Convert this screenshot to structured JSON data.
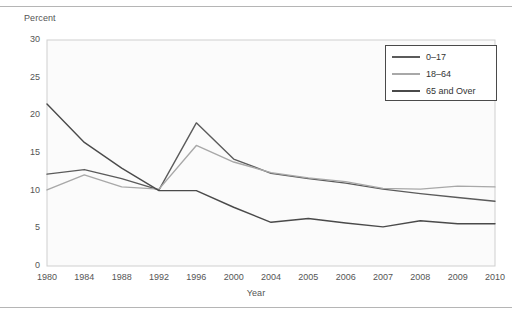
{
  "chart_data": {
    "type": "line",
    "title": "",
    "xlabel": "Year",
    "ylabel": "Percent",
    "categories": [
      "1980",
      "1984",
      "1988",
      "1992",
      "1996",
      "2000",
      "2004",
      "2005",
      "2006",
      "2007",
      "2008",
      "2009",
      "2010"
    ],
    "ylim": [
      0,
      30
    ],
    "yticks": [
      "0",
      "5",
      "10",
      "15",
      "20",
      "25",
      "30"
    ],
    "grid": false,
    "legend_position": "top-right",
    "series": [
      {
        "name": "0-17",
        "label": "0–17",
        "color": "#5b5b5b",
        "values": [
          12.2,
          12.8,
          11.6,
          10.1,
          19.0,
          14.2,
          12.3,
          11.6,
          11.0,
          10.2,
          9.6,
          9.1,
          8.6
        ]
      },
      {
        "name": "18-64",
        "label": "18–64",
        "color": "#a8a8a8",
        "values": [
          10.1,
          12.1,
          10.5,
          10.2,
          16.0,
          13.8,
          12.4,
          11.7,
          11.2,
          10.3,
          10.2,
          10.6,
          10.5
        ]
      },
      {
        "name": "65 and Over",
        "label": "65 and Over",
        "color": "#4a4a4a",
        "values": [
          21.5,
          16.4,
          13.0,
          10.0,
          10.0,
          7.8,
          5.8,
          6.3,
          5.7,
          5.2,
          6.0,
          5.6,
          5.6
        ]
      }
    ]
  },
  "legend": {
    "items": [
      {
        "label": "0–17"
      },
      {
        "label": "18–64"
      },
      {
        "label": "65 and Over"
      }
    ]
  },
  "axes": {
    "y_title": "Percent",
    "x_title": "Year"
  }
}
